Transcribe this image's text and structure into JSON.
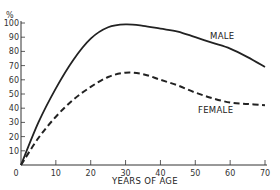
{
  "chart_data": {
    "type": "line",
    "title": "",
    "xlabel": "YEARS OF AGE",
    "ylabel": "%",
    "xlim": [
      0,
      70
    ],
    "ylim": [
      0,
      100
    ],
    "x_ticks": [
      0,
      10,
      20,
      30,
      40,
      50,
      60,
      70
    ],
    "y_ticks": [
      10,
      20,
      30,
      40,
      50,
      60,
      70,
      80,
      90,
      100
    ],
    "y_unit_label": "%",
    "grid": false,
    "legend": "inline labels",
    "x": [
      0,
      5,
      10,
      15,
      20,
      25,
      30,
      35,
      40,
      45,
      50,
      55,
      60,
      65,
      70
    ],
    "series": [
      {
        "name": "MALE",
        "style": "solid",
        "values": [
          0,
          30,
          54,
          74,
          89,
          97,
          99,
          98,
          96,
          94,
          90,
          86,
          82,
          76,
          69
        ]
      },
      {
        "name": "FEMALE",
        "style": "dashed",
        "values": [
          0,
          19,
          34,
          46,
          55,
          62,
          65,
          64,
          60,
          56,
          51,
          47,
          44,
          43,
          42
        ]
      }
    ]
  },
  "labels": {
    "y_unit": "%",
    "x_axis_title": "YEARS OF AGE",
    "male": "MALE",
    "female": "FEMALE",
    "origin": "0"
  }
}
